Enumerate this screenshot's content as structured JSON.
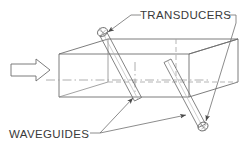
{
  "figure": {
    "kind": "engineering-line-diagram",
    "background_color": "#ffffff",
    "line_color": "#6e6e6e",
    "text_color": "#3a3a3a",
    "hidden_line_color": "#9a9a9a"
  },
  "labels": {
    "transducers": "TRANSDUCERS",
    "waveguides": "WAVEGUIDES"
  },
  "annotations": {
    "flow_arrow": "flow-direction-arrow",
    "duct": "rectangular-duct",
    "centerline": "duct-centerline",
    "waveguide_1": "waveguide-rod-upstream",
    "waveguide_2": "waveguide-rod-downstream",
    "transducer_1": "transducer-head-upper-left",
    "transducer_2": "transducer-head-lower-right"
  },
  "geometry": {
    "duct": {
      "front_top_left": [
        59,
        54
      ],
      "front_top_right": [
        189,
        54
      ],
      "front_bottom_left": [
        59,
        97
      ],
      "front_bottom_right": [
        189,
        97
      ],
      "back_top_left": [
        105,
        39
      ],
      "back_top_right": [
        238,
        39
      ],
      "back_bottom_right": [
        238,
        82
      ],
      "depth_offset": [
        49,
        -15
      ]
    },
    "centerline_y": 80,
    "waveguide_1": {
      "top": [
        103,
        33
      ],
      "bottom": [
        138,
        99
      ]
    },
    "waveguide_2": {
      "top": [
        167,
        60
      ],
      "bottom": [
        203,
        126
      ]
    },
    "arrow": {
      "tail_x": 10,
      "tip_x": 50,
      "axis_y": 70
    }
  }
}
